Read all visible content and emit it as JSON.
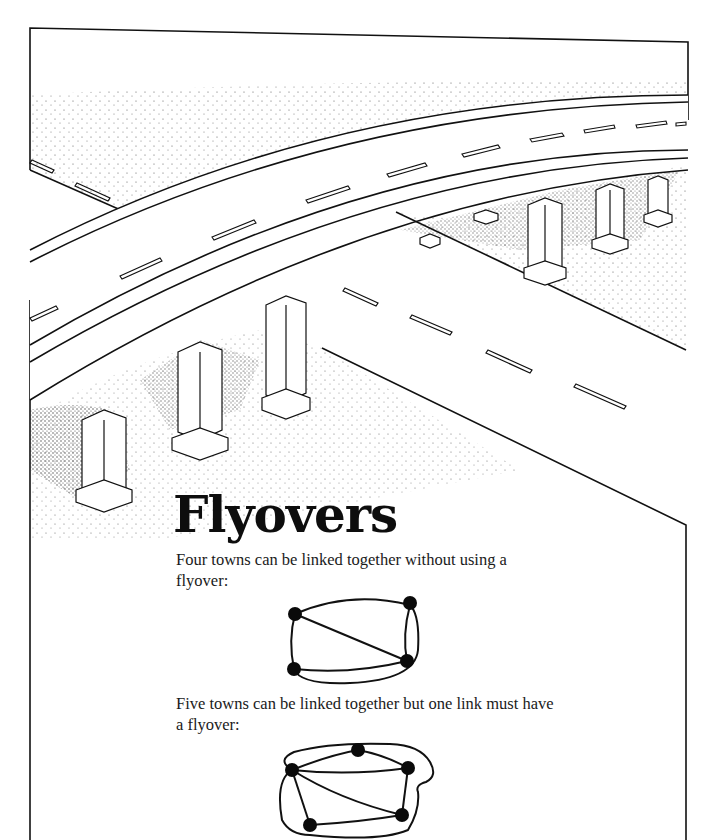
{
  "page": {
    "title": "Flyovers",
    "paragraphs": [
      "Four towns can be linked together without using a flyover:",
      "Five towns can be linked together but one link must have a flyover:"
    ]
  },
  "illustration": {
    "subject": "elevated curved highway flyover crossing a road, supported by pillars",
    "pillars_visible": 7
  },
  "diagrams": [
    {
      "name": "four-towns-graph",
      "towns": 4,
      "flyovers": 0
    },
    {
      "name": "five-towns-graph",
      "towns": 5,
      "flyovers": 1
    }
  ],
  "colors": {
    "ink": "#111111",
    "paper": "#ffffff"
  }
}
